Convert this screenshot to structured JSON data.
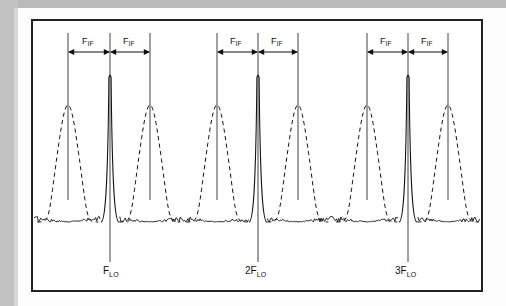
{
  "figure": {
    "kind": "spectrum-analyzer-trace",
    "border_color": "#222222",
    "trace_color": "#111111",
    "page_background": "#fdfdfd",
    "scan_band_color": "#b9b9b9"
  },
  "axis_labels": {
    "lo_labels": [
      {
        "id": "f-lo",
        "prefix": "F",
        "subscript": "LO",
        "x": 110
      },
      {
        "id": "2f-lo",
        "prefix": "2F",
        "subscript": "LO",
        "x": 258
      },
      {
        "id": "3f-lo",
        "prefix": "3F",
        "subscript": "LO",
        "x": 408
      }
    ],
    "if_label_prefix": "F",
    "if_label_subscript": "IF",
    "if_labels": [
      {
        "id": "if-1",
        "x": 89
      },
      {
        "id": "if-2",
        "x": 130
      },
      {
        "id": "if-3",
        "x": 237
      },
      {
        "id": "if-4",
        "x": 278
      },
      {
        "id": "if-5",
        "x": 387
      },
      {
        "id": "if-6",
        "x": 428
      }
    ]
  },
  "chart_data": {
    "type": "line",
    "title": "",
    "xlabel": "",
    "ylabel": "",
    "grid": false,
    "legend": false,
    "xlim": [
      31,
      483
    ],
    "ylim": [
      0,
      273
    ],
    "baseline_y": 222,
    "noise_amplitude_px": 6,
    "groups": [
      {
        "name": "fundamental",
        "lo_label": "F_LO",
        "lo_x": 110,
        "lo_peak_top_y": 77,
        "image_peak": {
          "x": 68,
          "top_y": 105,
          "half_width": 14,
          "style": "dashed"
        },
        "signal_peak": {
          "x": 150,
          "top_y": 105,
          "half_width": 14,
          "style": "dashed"
        },
        "if_left_span": [
          68,
          110
        ],
        "if_right_span": [
          110,
          150
        ]
      },
      {
        "name": "second-harmonic",
        "lo_label": "2F_LO",
        "lo_x": 258,
        "lo_peak_top_y": 77,
        "image_peak": {
          "x": 217,
          "top_y": 105,
          "half_width": 14,
          "style": "dashed"
        },
        "signal_peak": {
          "x": 298,
          "top_y": 105,
          "half_width": 14,
          "style": "dashed"
        },
        "if_left_span": [
          217,
          258
        ],
        "if_right_span": [
          258,
          298
        ]
      },
      {
        "name": "third-harmonic",
        "lo_label": "3F_LO",
        "lo_x": 408,
        "lo_peak_top_y": 77,
        "image_peak": {
          "x": 367,
          "top_y": 105,
          "half_width": 14,
          "style": "dashed"
        },
        "signal_peak": {
          "x": 448,
          "top_y": 105,
          "half_width": 14,
          "style": "dashed"
        },
        "if_left_span": [
          367,
          408
        ],
        "if_right_span": [
          408,
          448
        ]
      }
    ],
    "guide_lines": [
      {
        "x": 68,
        "y_top": 33,
        "y_bottom": 200
      },
      {
        "x": 110,
        "y_top": 33,
        "y_bottom": 262
      },
      {
        "x": 150,
        "y_top": 33,
        "y_bottom": 200
      },
      {
        "x": 217,
        "y_top": 33,
        "y_bottom": 200
      },
      {
        "x": 258,
        "y_top": 33,
        "y_bottom": 262
      },
      {
        "x": 298,
        "y_top": 33,
        "y_bottom": 200
      },
      {
        "x": 367,
        "y_top": 33,
        "y_bottom": 200
      },
      {
        "x": 408,
        "y_top": 33,
        "y_bottom": 262
      },
      {
        "x": 448,
        "y_top": 33,
        "y_bottom": 200
      }
    ],
    "dimension_arrow_y": 52
  }
}
